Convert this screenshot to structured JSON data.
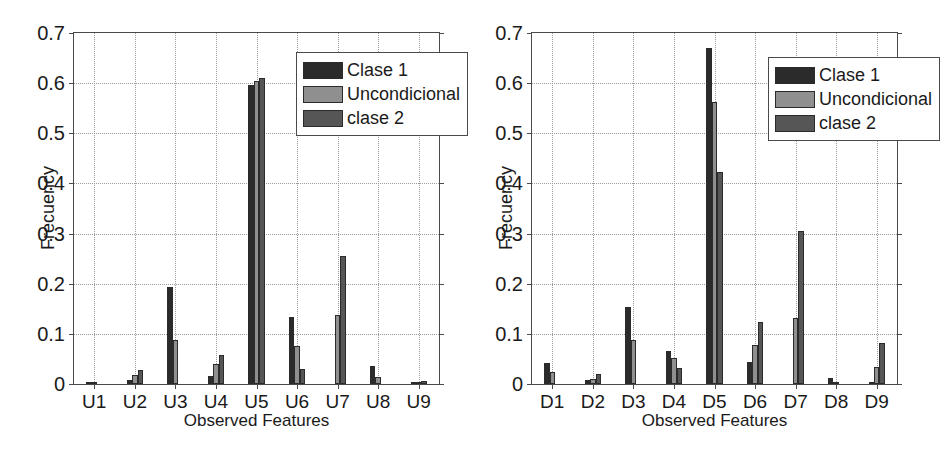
{
  "chart_data": [
    {
      "type": "bar",
      "panel": "left",
      "title": "",
      "xlabel": "Observed Features",
      "ylabel": "Frecuency",
      "categories": [
        "U1",
        "U2",
        "U3",
        "U4",
        "U5",
        "U6",
        "U7",
        "U8",
        "U9"
      ],
      "ylim": [
        0,
        0.7
      ],
      "yticks": [
        0,
        0.1,
        0.2,
        0.3,
        0.4,
        0.5,
        0.6,
        0.7
      ],
      "ytick_labels": [
        "0",
        "0.1",
        "0.2",
        "0.3",
        "0.4",
        "0.5",
        "0.6",
        "0.7"
      ],
      "grid": true,
      "legend_position": "upper right",
      "series": [
        {
          "name": "Clase 1",
          "color": "#2b2b2b",
          "values": [
            0.004,
            0.008,
            0.193,
            0.016,
            0.596,
            0.133,
            0.0,
            0.036,
            0.002
          ]
        },
        {
          "name": "Uncondicional",
          "color": "#8f8f8f",
          "values": [
            0.002,
            0.018,
            0.088,
            0.039,
            0.604,
            0.076,
            0.138,
            0.013,
            0.004
          ]
        },
        {
          "name": "clase 2",
          "color": "#565656",
          "values": [
            0.0,
            0.028,
            0.001,
            0.057,
            0.61,
            0.03,
            0.256,
            0.0,
            0.006
          ]
        }
      ]
    },
    {
      "type": "bar",
      "panel": "right",
      "title": "",
      "xlabel": "Observed Features",
      "ylabel": "Frecuency",
      "categories": [
        "D1",
        "D2",
        "D3",
        "D4",
        "D5",
        "D6",
        "D7",
        "D8",
        "D9"
      ],
      "ylim": [
        0,
        0.7
      ],
      "yticks": [
        0,
        0.1,
        0.2,
        0.3,
        0.4,
        0.5,
        0.6,
        0.7
      ],
      "ytick_labels": [
        "0",
        "0.1",
        "0.2",
        "0.3",
        "0.4",
        "0.5",
        "0.6",
        "0.7"
      ],
      "grid": true,
      "legend_position": "upper right",
      "series": [
        {
          "name": "Clase 1",
          "color": "#2b2b2b",
          "values": [
            0.041,
            0.008,
            0.153,
            0.066,
            0.67,
            0.043,
            0.0,
            0.011,
            0.002
          ]
        },
        {
          "name": "Uncondicional",
          "color": "#8f8f8f",
          "values": [
            0.024,
            0.01,
            0.087,
            0.051,
            0.562,
            0.077,
            0.131,
            0.005,
            0.034
          ]
        },
        {
          "name": "clase 2",
          "color": "#565656",
          "values": [
            0.0,
            0.02,
            0.0,
            0.031,
            0.422,
            0.124,
            0.305,
            0.0,
            0.081
          ]
        }
      ]
    }
  ],
  "legend": {
    "items": [
      {
        "label": "Clase 1",
        "color": "#2b2b2b"
      },
      {
        "label": "Uncondicional",
        "color": "#8f8f8f"
      },
      {
        "label": "clase 2",
        "color": "#565656"
      }
    ]
  }
}
